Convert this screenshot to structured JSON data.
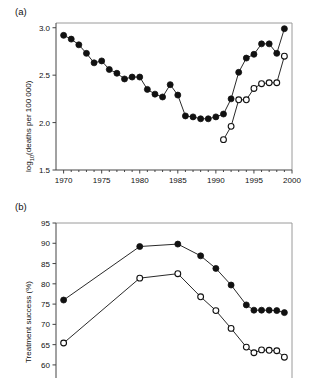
{
  "figure": {
    "panel_a_label": "(a)",
    "panel_b_label": "(b)"
  },
  "chart_data": [
    {
      "id": "panel-a",
      "type": "line",
      "title": "",
      "panel_label": "(a)",
      "xlabel": "",
      "ylabel": "log₁₀(deaths per 100 000)",
      "ylabel_base": "log",
      "ylabel_sub": "10",
      "ylabel_rest": "(deaths per 100 000)",
      "xlim": [
        1969,
        2000
      ],
      "ylim": [
        1.5,
        3.05
      ],
      "xticks": [
        1970,
        1975,
        1980,
        1985,
        1990,
        1995,
        2000
      ],
      "xticklabels": [
        "1970",
        "1975",
        "1980",
        "1985",
        "1990",
        "1995",
        "2000"
      ],
      "xminorticks": [
        1971,
        1972,
        1973,
        1974,
        1976,
        1977,
        1978,
        1979,
        1981,
        1982,
        1983,
        1984,
        1986,
        1987,
        1988,
        1989,
        1991,
        1992,
        1993,
        1994,
        1996,
        1997,
        1998,
        1999
      ],
      "yticks": [
        1.5,
        2.0,
        2.5,
        3.0
      ],
      "yticklabels": [
        "1.5",
        "2.0",
        "2.5",
        "3.0"
      ],
      "grid": false,
      "legend": "none",
      "series": [
        {
          "name": "filled-circles",
          "marker": "filled-circle",
          "x": [
            1970,
            1971,
            1972,
            1973,
            1974,
            1975,
            1976,
            1977,
            1978,
            1979,
            1980,
            1981,
            1982,
            1983,
            1984,
            1985,
            1986,
            1987,
            1988,
            1989,
            1990,
            1991,
            1992,
            1993,
            1994,
            1995,
            1996,
            1997,
            1998,
            1999
          ],
          "values": [
            2.92,
            2.88,
            2.82,
            2.73,
            2.63,
            2.65,
            2.56,
            2.52,
            2.46,
            2.48,
            2.48,
            2.35,
            2.3,
            2.27,
            2.4,
            2.29,
            2.07,
            2.06,
            2.04,
            2.04,
            2.06,
            2.09,
            2.25,
            2.53,
            2.68,
            2.72,
            2.83,
            2.83,
            2.73,
            2.99
          ]
        },
        {
          "name": "open-circles",
          "marker": "open-circle",
          "x": [
            1991,
            1992,
            1993,
            1994,
            1995,
            1996,
            1997,
            1998,
            1999
          ],
          "values": [
            1.82,
            1.96,
            2.24,
            2.24,
            2.36,
            2.41,
            2.42,
            2.42,
            2.7
          ]
        }
      ]
    },
    {
      "id": "panel-b",
      "type": "line",
      "title": "",
      "panel_label": "(b)",
      "xlabel": "",
      "ylabel": "Treatment success (%)",
      "xlim": [
        1969,
        2000
      ],
      "ylim": [
        58.5,
        95
      ],
      "yticks": [
        60,
        65,
        70,
        75,
        80,
        85,
        90,
        95
      ],
      "yticklabels": [
        "60",
        "65",
        "70",
        "75",
        "80",
        "85",
        "90",
        "95"
      ],
      "grid": false,
      "legend": "none",
      "note": "x-axis cropped below image edge",
      "series": [
        {
          "name": "filled-circles",
          "marker": "filled-circle",
          "x": [
            1970,
            1980,
            1985,
            1988,
            1990,
            1992,
            1994,
            1995,
            1996,
            1997,
            1998,
            1999
          ],
          "values": [
            76.0,
            89.2,
            89.8,
            86.9,
            83.8,
            79.7,
            74.8,
            73.5,
            73.5,
            73.5,
            73.4,
            72.9
          ]
        },
        {
          "name": "open-circles",
          "marker": "open-circle",
          "x": [
            1970,
            1980,
            1985,
            1988,
            1990,
            1992,
            1994,
            1995,
            1996,
            1997,
            1998,
            1999
          ],
          "values": [
            65.4,
            81.4,
            82.5,
            76.8,
            73.4,
            69.0,
            64.4,
            63.0,
            63.7,
            63.6,
            63.5,
            61.9
          ]
        }
      ]
    }
  ]
}
